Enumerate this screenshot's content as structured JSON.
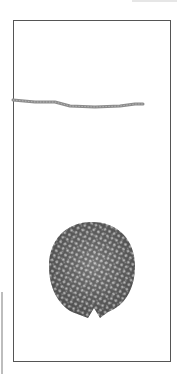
{
  "figure": {
    "frame": {
      "x": 13,
      "y": 20,
      "width": 158,
      "height": 342,
      "border_color": "#555555"
    },
    "rod": {
      "points": [
        [
          13,
          100
        ],
        [
          35,
          102
        ],
        [
          55,
          102
        ],
        [
          70,
          106
        ],
        [
          95,
          107
        ],
        [
          120,
          106
        ],
        [
          135,
          104
        ],
        [
          143,
          104
        ]
      ],
      "color": "#8a8a8a",
      "thickness": 3
    },
    "disc": {
      "center": [
        92,
        268
      ],
      "radius_x": 43,
      "radius_y": 47,
      "fill": "#5a5a5a",
      "dot_color": "#c8c8c8",
      "notch": {
        "x": 93,
        "y": 316
      }
    },
    "colors": {
      "background": "#ffffff",
      "artifact": "#bdbdbd"
    }
  }
}
